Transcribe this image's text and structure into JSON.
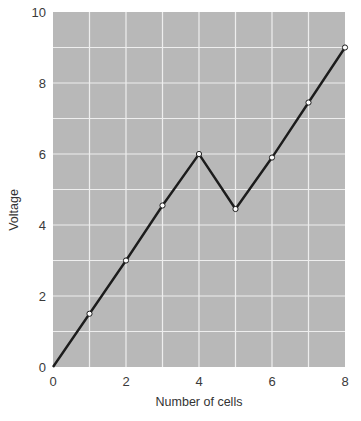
{
  "chart_data": {
    "type": "line",
    "title": "",
    "xlabel": "Number of cells",
    "ylabel": "Voltage",
    "xlim": [
      0,
      8
    ],
    "ylim": [
      0,
      10
    ],
    "x_ticks": [
      0,
      2,
      4,
      6,
      8
    ],
    "y_ticks": [
      0,
      2,
      4,
      6,
      8,
      10
    ],
    "grid": true,
    "grid_x_step": 1,
    "grid_y_step": 1,
    "legend": null,
    "series": [
      {
        "name": "Voltage",
        "x": [
          0,
          1,
          2,
          3,
          4,
          5,
          6,
          7,
          8
        ],
        "values": [
          0,
          1.5,
          3.0,
          4.55,
          6.0,
          4.45,
          5.9,
          7.45,
          9.0
        ],
        "markers": [
          false,
          true,
          true,
          true,
          true,
          true,
          true,
          true,
          true
        ]
      }
    ]
  },
  "style": {
    "plot_background": "#b8b8b8",
    "grid_color": "#eeeeee",
    "line_color": "#1c1c1c",
    "marker_fill": "#ffffff"
  }
}
